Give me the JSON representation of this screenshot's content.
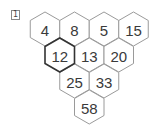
{
  "problem_label": "1",
  "pyramid": {
    "rows": [
      [
        {
          "value": "4"
        },
        {
          "value": "8"
        },
        {
          "value": "5"
        },
        {
          "value": "15"
        }
      ],
      [
        {
          "value": "12",
          "highlighted": true
        },
        {
          "value": "13"
        },
        {
          "value": "20"
        }
      ],
      [
        {
          "value": "25"
        },
        {
          "value": "33"
        }
      ],
      [
        {
          "value": "58"
        }
      ]
    ]
  }
}
